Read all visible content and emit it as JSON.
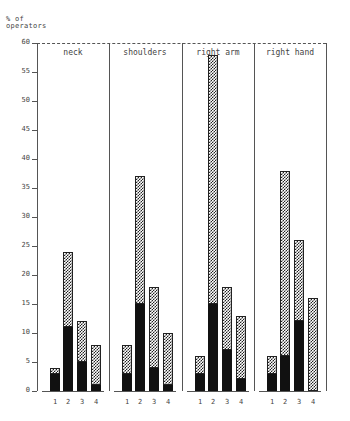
{
  "chart_data": {
    "type": "bar",
    "stacked": true,
    "title": "",
    "ylabel": "% of operators",
    "xlabel": "",
    "ylim": [
      0,
      60
    ],
    "yticks": [
      0,
      5,
      10,
      15,
      20,
      25,
      30,
      35,
      40,
      45,
      50,
      55,
      60
    ],
    "categories": [
      "1",
      "2",
      "3",
      "4"
    ],
    "grid": false,
    "legend": null,
    "panels": [
      {
        "name": "neck",
        "series": [
          {
            "name": "solid (lower segment)",
            "values": [
              3,
              11,
              5,
              1
            ]
          },
          {
            "name": "total (hatched top)",
            "values": [
              4,
              24,
              12,
              8
            ]
          }
        ]
      },
      {
        "name": "shoulders",
        "series": [
          {
            "name": "solid (lower segment)",
            "values": [
              3,
              15,
              4,
              1
            ]
          },
          {
            "name": "total (hatched top)",
            "values": [
              8,
              37,
              18,
              10
            ]
          }
        ]
      },
      {
        "name": "right arm",
        "series": [
          {
            "name": "solid (lower segment)",
            "values": [
              3,
              15,
              7,
              2
            ]
          },
          {
            "name": "total (hatched top)",
            "values": [
              6,
              58,
              18,
              13
            ]
          }
        ]
      },
      {
        "name": "right hand",
        "series": [
          {
            "name": "solid (lower segment)",
            "values": [
              3,
              6,
              12,
              0
            ]
          },
          {
            "name": "total (hatched top)",
            "values": [
              6,
              38,
              26,
              16
            ]
          }
        ]
      }
    ]
  },
  "labels": {
    "ylabel_line1": "% of",
    "ylabel_line2": "operators"
  },
  "colors": {
    "solid": "#111111",
    "hatch": "#222222",
    "axis": "#555555"
  }
}
